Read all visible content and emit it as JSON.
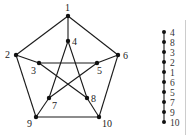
{
  "graph": {
    "name": "Petersen graph",
    "nodes": [
      {
        "id": "1",
        "x": 68,
        "y": 16,
        "lx": 65,
        "ly": 11
      },
      {
        "id": "2",
        "x": 16,
        "y": 55,
        "lx": 5,
        "ly": 58
      },
      {
        "id": "3",
        "x": 39,
        "y": 63,
        "lx": 31,
        "ly": 74
      },
      {
        "id": "4",
        "x": 68,
        "y": 41,
        "lx": 72,
        "ly": 45
      },
      {
        "id": "5",
        "x": 97,
        "y": 63,
        "lx": 97,
        "ly": 74
      },
      {
        "id": "6",
        "x": 118,
        "y": 55,
        "lx": 123,
        "ly": 59
      },
      {
        "id": "7",
        "x": 49,
        "y": 98,
        "lx": 52,
        "ly": 109
      },
      {
        "id": "8",
        "x": 87,
        "y": 98,
        "lx": 91,
        "ly": 102
      },
      {
        "id": "9",
        "x": 36,
        "y": 117,
        "lx": 27,
        "ly": 127
      },
      {
        "id": "10",
        "x": 99,
        "y": 117,
        "lx": 102,
        "ly": 127
      }
    ],
    "edges": [
      [
        "1",
        "2"
      ],
      [
        "2",
        "9"
      ],
      [
        "9",
        "10"
      ],
      [
        "10",
        "6"
      ],
      [
        "6",
        "1"
      ],
      [
        "1",
        "4"
      ],
      [
        "2",
        "3"
      ],
      [
        "6",
        "5"
      ],
      [
        "9",
        "7"
      ],
      [
        "10",
        "8"
      ],
      [
        "4",
        "7"
      ],
      [
        "4",
        "8"
      ],
      [
        "3",
        "5"
      ],
      [
        "3",
        "8"
      ],
      [
        "5",
        "7"
      ]
    ]
  },
  "path": {
    "name": "Vertex ordering path",
    "x": 164,
    "y_start": 32,
    "spacing": 10,
    "label_x": 170,
    "order": [
      "4",
      "8",
      "3",
      "2",
      "1",
      "6",
      "5",
      "7",
      "9",
      "10"
    ]
  },
  "colors": {
    "edge": "#1a1a1a",
    "node": "#111111",
    "label": "#222222",
    "background": "#ffffff"
  }
}
